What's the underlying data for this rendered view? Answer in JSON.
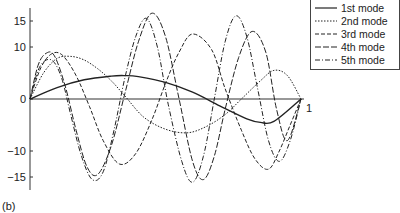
{
  "chart_data": {
    "type": "line",
    "title": "",
    "xlabel": "",
    "ylabel": "",
    "xlim": [
      0,
      1
    ],
    "ylim": [
      -17.5,
      18
    ],
    "x_ticks": [
      {
        "value": 1,
        "label": "1"
      }
    ],
    "y_ticks": [
      {
        "value": 15,
        "label": "15"
      },
      {
        "value": 10,
        "label": "10"
      },
      {
        "value": 0,
        "label": "0"
      },
      {
        "value": -10,
        "label": "−10"
      },
      {
        "value": -15,
        "label": "−15"
      }
    ],
    "grid": false,
    "legend_position": "top-right",
    "series": [
      {
        "name": "1st mode",
        "dash": "",
        "x": [
          0,
          0.1,
          0.2,
          0.3,
          0.35,
          0.4,
          0.5,
          0.6,
          0.7,
          0.8,
          0.85,
          0.9,
          1.0
        ],
        "values": [
          0,
          2.2,
          3.7,
          4.4,
          4.5,
          4.3,
          3.2,
          1.3,
          -1.3,
          -3.8,
          -4.5,
          -4.3,
          0
        ]
      },
      {
        "name": "2nd mode",
        "dash": "1.5,1.5",
        "x": [
          0,
          0.05,
          0.1,
          0.15,
          0.2,
          0.25,
          0.3,
          0.35,
          0.42,
          0.5,
          0.58,
          0.65,
          0.72,
          0.78,
          0.85,
          0.9,
          0.95,
          1.0
        ],
        "values": [
          0,
          5,
          7.8,
          8.2,
          7.5,
          5.8,
          3.5,
          0.6,
          -3.5,
          -5.8,
          -6.5,
          -5.3,
          -3,
          0,
          3.5,
          5.5,
          4.5,
          0
        ]
      },
      {
        "name": "3rd mode",
        "dash": "4,2",
        "x": [
          0,
          0.04,
          0.08,
          0.12,
          0.17,
          0.22,
          0.27,
          0.33,
          0.39,
          0.45,
          0.5,
          0.55,
          0.6,
          0.67,
          0.72,
          0.78,
          0.83,
          0.88,
          0.92,
          0.96,
          1.0
        ],
        "values": [
          0,
          6,
          8.7,
          8.4,
          4.5,
          -1.5,
          -8,
          -12.5,
          -10.5,
          -4,
          3,
          9,
          12.5,
          9.5,
          2,
          -6,
          -11.5,
          -13.5,
          -10,
          -5,
          0
        ]
      },
      {
        "name": "4th mode",
        "dash": "6,2",
        "x": [
          0,
          0.03,
          0.06,
          0.09,
          0.13,
          0.17,
          0.21,
          0.25,
          0.3,
          0.35,
          0.4,
          0.45,
          0.5,
          0.55,
          0.6,
          0.64,
          0.68,
          0.72,
          0.77,
          0.82,
          0.87,
          0.91,
          0.95,
          1.0
        ],
        "values": [
          0,
          6.5,
          8.8,
          8.3,
          2.5,
          -6,
          -13,
          -14.5,
          -9,
          1,
          11,
          16.5,
          12,
          0,
          -12,
          -15.5,
          -11,
          -2,
          8,
          13,
          9,
          -2,
          -8,
          0
        ]
      },
      {
        "name": "5th mode",
        "dash": "5,2,1,2",
        "x": [
          0,
          0.03,
          0.06,
          0.09,
          0.12,
          0.15,
          0.19,
          0.23,
          0.27,
          0.31,
          0.35,
          0.39,
          0.43,
          0.47,
          0.51,
          0.56,
          0.6,
          0.64,
          0.68,
          0.72,
          0.76,
          0.8,
          0.84,
          0.88,
          0.92,
          0.96,
          1.0
        ],
        "values": [
          0,
          5.5,
          7.5,
          7,
          3.5,
          -3,
          -11,
          -15.5,
          -14,
          -6,
          4,
          12,
          15.5,
          10,
          -1,
          -12,
          -16,
          -11,
          0,
          11,
          16,
          12,
          2,
          -8,
          -12,
          -8,
          0
        ]
      }
    ]
  },
  "legend": {
    "items": [
      "1st mode",
      "2nd mode",
      "3rd mode",
      "4th mode",
      "5th mode"
    ]
  },
  "caption": "(b)"
}
